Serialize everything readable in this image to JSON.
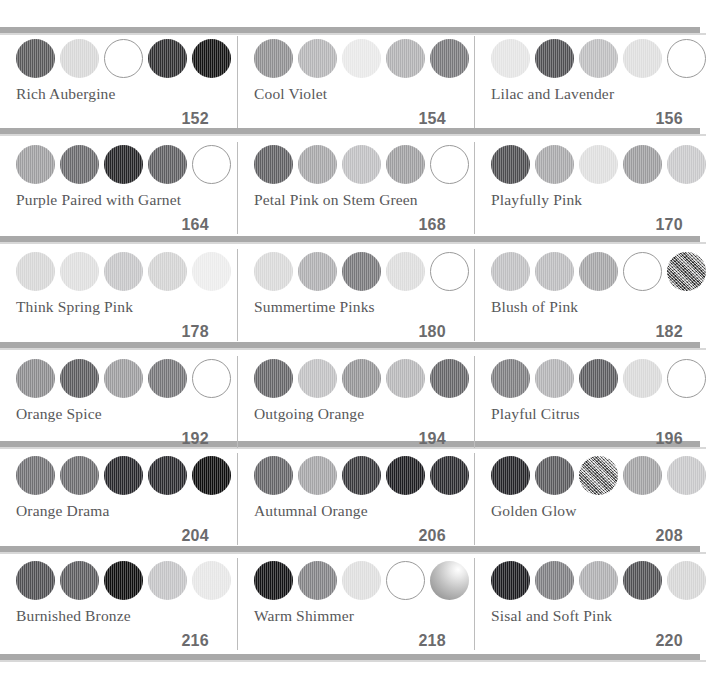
{
  "page": {
    "background": "#ffffff",
    "rule_color": "#a9a9a9",
    "divider_color": "#bcbcbc",
    "name_color": "#58585a",
    "number_color": "#6b6b6d"
  },
  "rows": [
    {
      "cards": [
        {
          "name": "Rich Aubergine",
          "number": "152",
          "swatches": [
            {
              "color": "#575759",
              "style": "solid"
            },
            {
              "color": "#d7d7d7",
              "style": "solid"
            },
            {
              "color": "#ffffff",
              "style": "outline"
            },
            {
              "color": "#2d2d2f",
              "style": "solid"
            },
            {
              "color": "#121212",
              "style": "solid"
            }
          ]
        },
        {
          "name": "Cool Violet",
          "number": "154",
          "swatches": [
            {
              "color": "#8e8e90",
              "style": "solid"
            },
            {
              "color": "#b4b4b6",
              "style": "solid"
            },
            {
              "color": "#e8e8e8",
              "style": "solid"
            },
            {
              "color": "#b0b0b2",
              "style": "solid"
            },
            {
              "color": "#77777a",
              "style": "solid"
            }
          ]
        },
        {
          "name": "Lilac and Lavender",
          "number": "156",
          "swatches": [
            {
              "color": "#e4e4e4",
              "style": "solid"
            },
            {
              "color": "#4e4e51",
              "style": "solid"
            },
            {
              "color": "#bdbdbf",
              "style": "solid"
            },
            {
              "color": "#dedede",
              "style": "solid"
            },
            {
              "color": "#ffffff",
              "style": "outline"
            }
          ]
        }
      ]
    },
    {
      "cards": [
        {
          "name": "Purple Paired with Garnet",
          "number": "164",
          "swatches": [
            {
              "color": "#9d9d9f",
              "style": "solid"
            },
            {
              "color": "#68686b",
              "style": "solid"
            },
            {
              "color": "#232325",
              "style": "solid"
            },
            {
              "color": "#5d5d60",
              "style": "solid"
            },
            {
              "color": "#ffffff",
              "style": "outline"
            }
          ]
        },
        {
          "name": "Petal Pink on Stem Green",
          "number": "168",
          "swatches": [
            {
              "color": "#5e5e61",
              "style": "solid"
            },
            {
              "color": "#a5a5a7",
              "style": "solid"
            },
            {
              "color": "#bfbfc1",
              "style": "solid"
            },
            {
              "color": "#9d9d9f",
              "style": "solid"
            },
            {
              "color": "#ffffff",
              "style": "outline"
            }
          ]
        },
        {
          "name": "Playfully Pink",
          "number": "170",
          "swatches": [
            {
              "color": "#4b4b4e",
              "style": "solid"
            },
            {
              "color": "#a7a7a9",
              "style": "solid"
            },
            {
              "color": "#dedede",
              "style": "solid"
            },
            {
              "color": "#9b9b9d",
              "style": "solid"
            },
            {
              "color": "#c8c8ca",
              "style": "solid"
            }
          ]
        }
      ]
    },
    {
      "cards": [
        {
          "name": "Think Spring Pink",
          "number": "178",
          "swatches": [
            {
              "color": "#d6d6d6",
              "style": "solid"
            },
            {
              "color": "#dedede",
              "style": "solid"
            },
            {
              "color": "#c5c5c7",
              "style": "solid"
            },
            {
              "color": "#d2d2d2",
              "style": "solid"
            },
            {
              "color": "#ececec",
              "style": "solid"
            }
          ]
        },
        {
          "name": "Summertime Pinks",
          "number": "180",
          "swatches": [
            {
              "color": "#d8d8d8",
              "style": "solid"
            },
            {
              "color": "#aeaeb0",
              "style": "solid"
            },
            {
              "color": "#77777a",
              "style": "solid"
            },
            {
              "color": "#dcdcdc",
              "style": "solid"
            },
            {
              "color": "#ffffff",
              "style": "outline"
            }
          ]
        },
        {
          "name": "Blush of Pink",
          "number": "182",
          "swatches": [
            {
              "color": "#bfbfc1",
              "style": "solid"
            },
            {
              "color": "#bbbbbd",
              "style": "solid"
            },
            {
              "color": "#a3a3a5",
              "style": "solid"
            },
            {
              "color": "#ffffff",
              "style": "outline"
            },
            {
              "color": "#8a8a8c",
              "style": "mottled"
            }
          ]
        }
      ]
    },
    {
      "cards": [
        {
          "name": "Orange Spice",
          "number": "192",
          "swatches": [
            {
              "color": "#8a8a8c",
              "style": "solid"
            },
            {
              "color": "#5a5a5d",
              "style": "solid"
            },
            {
              "color": "#9b9b9d",
              "style": "solid"
            },
            {
              "color": "#747477",
              "style": "solid"
            },
            {
              "color": "#ffffff",
              "style": "outline"
            }
          ]
        },
        {
          "name": "Outgoing Orange",
          "number": "194",
          "swatches": [
            {
              "color": "#646467",
              "style": "solid"
            },
            {
              "color": "#c0c0c2",
              "style": "solid"
            },
            {
              "color": "#939395",
              "style": "solid"
            },
            {
              "color": "#b6b6b8",
              "style": "solid"
            },
            {
              "color": "#646467",
              "style": "solid"
            }
          ]
        },
        {
          "name": "Playful Citrus",
          "number": "196",
          "swatches": [
            {
              "color": "#7c7c7f",
              "style": "solid"
            },
            {
              "color": "#b2b2b4",
              "style": "solid"
            },
            {
              "color": "#5b5b5e",
              "style": "solid"
            },
            {
              "color": "#d9d9d9",
              "style": "solid"
            },
            {
              "color": "#ffffff",
              "style": "outline"
            }
          ]
        }
      ]
    },
    {
      "cards": [
        {
          "name": "Orange Drama",
          "number": "204",
          "swatches": [
            {
              "color": "#6f6f72",
              "style": "solid"
            },
            {
              "color": "#6a6a6d",
              "style": "solid"
            },
            {
              "color": "#25252a",
              "style": "solid"
            },
            {
              "color": "#28282c",
              "style": "solid"
            },
            {
              "color": "#0c0c0c",
              "style": "solid"
            }
          ]
        },
        {
          "name": "Autumnal Orange",
          "number": "206",
          "swatches": [
            {
              "color": "#636366",
              "style": "solid"
            },
            {
              "color": "#a4a4a6",
              "style": "solid"
            },
            {
              "color": "#36363a",
              "style": "solid"
            },
            {
              "color": "#1c1c20",
              "style": "solid"
            },
            {
              "color": "#29292d",
              "style": "solid"
            }
          ]
        },
        {
          "name": "Golden Glow",
          "number": "208",
          "swatches": [
            {
              "color": "#232327",
              "style": "solid"
            },
            {
              "color": "#59595c",
              "style": "solid"
            },
            {
              "color": "#b5b5b7",
              "style": "mottled"
            },
            {
              "color": "#a0a0a2",
              "style": "solid"
            },
            {
              "color": "#c7c7c9",
              "style": "solid"
            }
          ]
        }
      ]
    },
    {
      "cards": [
        {
          "name": "Burnished Bronze",
          "number": "216",
          "swatches": [
            {
              "color": "#4e4e51",
              "style": "solid"
            },
            {
              "color": "#5a5a5d",
              "style": "solid"
            },
            {
              "color": "#0d0d0d",
              "style": "solid"
            },
            {
              "color": "#c3c3c5",
              "style": "solid"
            },
            {
              "color": "#e6e6e6",
              "style": "solid"
            }
          ]
        },
        {
          "name": "Warm Shimmer",
          "number": "218",
          "swatches": [
            {
              "color": "#111113",
              "style": "solid"
            },
            {
              "color": "#818184",
              "style": "solid"
            },
            {
              "color": "#dedede",
              "style": "solid"
            },
            {
              "color": "#ffffff",
              "style": "outline"
            },
            {
              "color": "#b7b7b9",
              "style": "shimmer"
            }
          ]
        },
        {
          "name": "Sisal and Soft Pink",
          "number": "220",
          "swatches": [
            {
              "color": "#1a1a1e",
              "style": "solid"
            },
            {
              "color": "#7d7d80",
              "style": "solid"
            },
            {
              "color": "#aeaeb0",
              "style": "solid"
            },
            {
              "color": "#4f4f52",
              "style": "solid"
            },
            {
              "color": "#d5d5d5",
              "style": "solid"
            }
          ]
        }
      ]
    }
  ],
  "layout": {
    "row_tops": [
      36,
      142,
      249,
      356,
      453,
      558
    ],
    "rule_tops": [
      27,
      128,
      236,
      342,
      441,
      546,
      654
    ]
  }
}
